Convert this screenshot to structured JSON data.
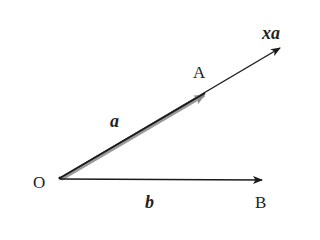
{
  "diagram": {
    "type": "vector-diagram",
    "points": {
      "origin": {
        "label": "O"
      },
      "A": {
        "label": "A"
      },
      "B": {
        "label": "B"
      }
    },
    "vectors": {
      "a": {
        "label": "a",
        "from": "O",
        "to": "A",
        "style": "thick gray-shadowed arrow"
      },
      "xa": {
        "label": "xa",
        "from": "O",
        "direction": "same as a, extended beyond A"
      },
      "b": {
        "label": "b",
        "from": "O",
        "to": "B"
      }
    },
    "colors": {
      "line": "#1a1a1a",
      "shadow": "#9a9a9a",
      "background": "#ffffff"
    }
  }
}
